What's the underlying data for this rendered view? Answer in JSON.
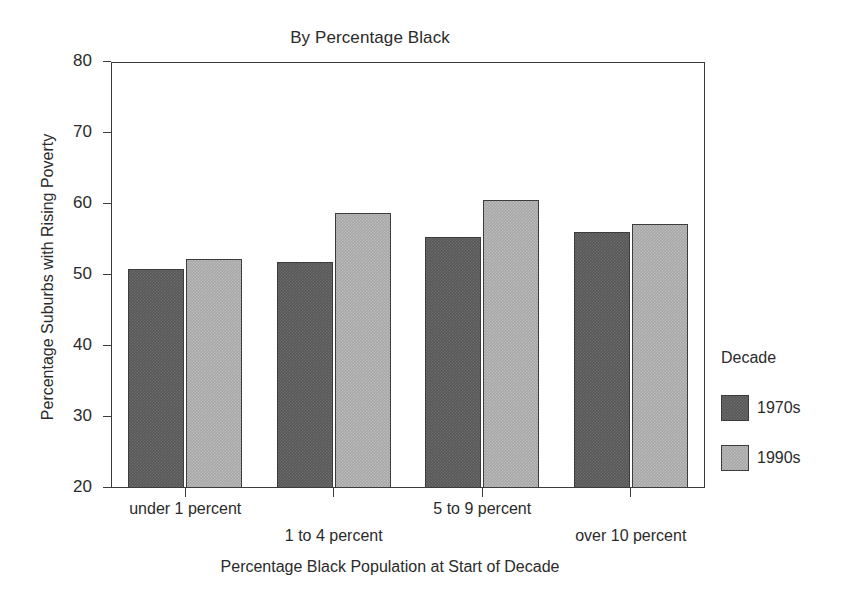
{
  "chart_data": {
    "type": "bar",
    "title": "By Percentage Black",
    "xlabel": "Percentage Black Population at Start of Decade",
    "ylabel": "Percentage Suburbs with Rising Poverty",
    "categories": [
      "under 1 percent",
      "1 to 4 percent",
      "5 to 9 percent",
      "over 10 percent"
    ],
    "series": [
      {
        "name": "1970s",
        "color": "#585858",
        "values": [
          50.8,
          51.8,
          55.3,
          56.0
        ]
      },
      {
        "name": "1990s",
        "color": "#a7a7a7",
        "values": [
          52.3,
          58.7,
          60.6,
          57.2
        ]
      }
    ],
    "ylim": [
      20,
      80
    ],
    "yticks": [
      80,
      70,
      60,
      50,
      40,
      30,
      20
    ],
    "ytick_labels": [
      "80",
      "70",
      "60",
      "50",
      "40",
      "30",
      "20"
    ],
    "grid": false,
    "legend": {
      "title": "Decade",
      "position": "right",
      "entries": [
        "1970s",
        "1990s"
      ]
    }
  }
}
